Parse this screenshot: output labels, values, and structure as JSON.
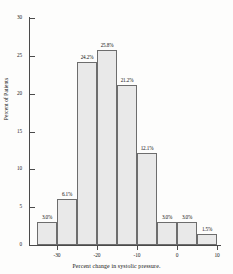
{
  "chart_data": {
    "type": "bar",
    "title": "",
    "subtitle": "",
    "xlabel": "Percent change in systolic pressure.",
    "ylabel": "Percent of Patients",
    "categories": [
      "-35 to -30",
      "-30 to -25",
      "-25 to -20",
      "-20 to -15",
      "-15 to -10",
      "-10 to -5",
      "-5 to 0",
      "0 to 5",
      "5 to 10"
    ],
    "bin_edges": [
      -35,
      -30,
      -25,
      -20,
      -15,
      -10,
      -5,
      0,
      5,
      10
    ],
    "values": [
      3.0,
      6.1,
      24.2,
      25.8,
      21.2,
      12.1,
      3.0,
      3.0,
      1.5
    ],
    "data_labels": [
      "3.0%",
      "6.1%",
      "24.2%",
      "25.8%",
      "21.2%",
      "12.1%",
      "3.0%",
      "3.0%",
      "1.5%"
    ],
    "xlim": [
      -37,
      11
    ],
    "ylim": [
      0,
      30
    ],
    "xticks": [
      -30,
      -20,
      -10,
      0,
      10
    ],
    "xtick_labels": [
      "-30",
      "-20",
      "-10",
      "0",
      "10"
    ],
    "yticks": [
      0,
      5,
      10,
      15,
      20,
      25,
      30
    ],
    "ytick_labels": [
      "0",
      "5",
      "10",
      "15",
      "20",
      "25",
      "30"
    ],
    "grid": false,
    "legend": null,
    "bar_fill_color": "#e9e9e9",
    "bar_edge_color": "#6d6d6d",
    "axis_color": "#4a4a4a",
    "text_color": "#111111",
    "background_color": "#fdfdfc"
  }
}
